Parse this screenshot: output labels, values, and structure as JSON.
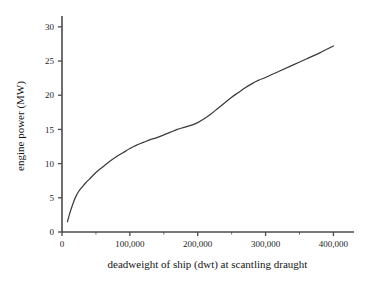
{
  "chart_data": {
    "type": "line",
    "title": "",
    "subtitle": "",
    "xlabel": "deadweight of ship (dwt) at scantling draught",
    "ylabel": "engine power (MW)",
    "xlim": [
      0,
      420000
    ],
    "ylim": [
      0,
      31
    ],
    "grid": false,
    "legend": "none",
    "x_ticks": [
      0,
      100000,
      200000,
      300000,
      400000
    ],
    "x_tick_labels": [
      "0",
      "100,000",
      "200,000",
      "300,000",
      "400,000"
    ],
    "x_minor_ticks": [
      50000,
      150000,
      250000,
      350000
    ],
    "y_ticks": [
      0,
      5,
      10,
      15,
      20,
      25,
      30
    ],
    "y_tick_labels": [
      "0",
      "5",
      "10",
      "15",
      "20",
      "25",
      "30"
    ],
    "series": [
      {
        "name": "engine power vs deadweight",
        "color": "#3b3b3b",
        "x": [
          8000,
          12000,
          16000,
          20000,
          25000,
          30000,
          35000,
          40000,
          50000,
          60000,
          70000,
          80000,
          90000,
          100000,
          110000,
          120000,
          130000,
          140000,
          150000,
          160000,
          170000,
          180000,
          190000,
          200000,
          210000,
          220000,
          230000,
          240000,
          250000,
          260000,
          270000,
          280000,
          290000,
          300000,
          320000,
          340000,
          360000,
          380000,
          400000
        ],
        "y": [
          1.5,
          2.9,
          4.1,
          5.1,
          6.0,
          6.6,
          7.2,
          7.7,
          8.7,
          9.5,
          10.3,
          11.0,
          11.6,
          12.2,
          12.7,
          13.1,
          13.5,
          13.8,
          14.2,
          14.6,
          15.0,
          15.3,
          15.6,
          16.0,
          16.6,
          17.3,
          18.1,
          18.9,
          19.7,
          20.4,
          21.1,
          21.7,
          22.2,
          22.6,
          23.5,
          24.4,
          25.3,
          26.2,
          27.2
        ]
      }
    ]
  },
  "axes": {
    "y_axis_name": "engine-power-axis",
    "x_axis_name": "deadweight-axis"
  },
  "colors": {
    "curve": "#3b3b3b",
    "axis": "#4a4a4a",
    "text": "#1c1c1c",
    "background": "#ffffff"
  }
}
